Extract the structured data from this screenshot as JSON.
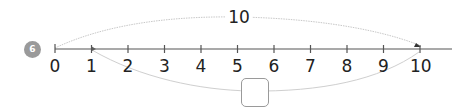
{
  "problem": {
    "number": "6",
    "badge_color": "#9a9a9a"
  },
  "number_line": {
    "min": 0,
    "max": 10,
    "tick_labels": [
      "0",
      "1",
      "2",
      "3",
      "4",
      "5",
      "6",
      "7",
      "8",
      "9",
      "10"
    ],
    "line_color": "#555555"
  },
  "arcs": {
    "top": {
      "from": "0",
      "to": "10",
      "label": "10"
    },
    "bottom": {
      "from": "1",
      "to": "10",
      "label": ""
    }
  },
  "answer_box": {
    "value": ""
  }
}
